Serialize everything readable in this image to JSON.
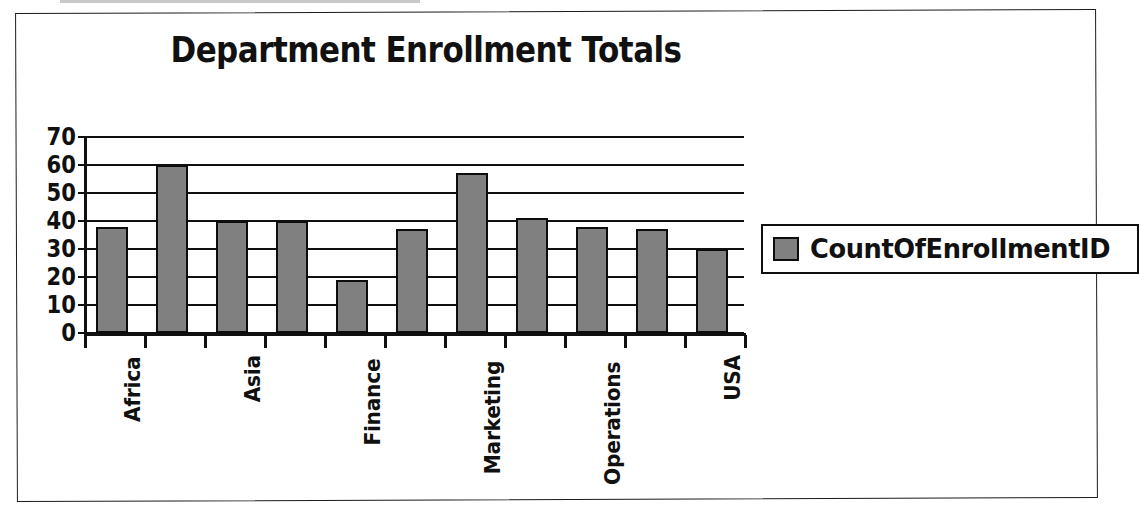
{
  "chart_data": {
    "type": "bar",
    "title": "Department Enrollment Totals",
    "xlabel": "",
    "ylabel": "",
    "ylim": [
      0,
      70
    ],
    "yticks": [
      0,
      10,
      20,
      30,
      40,
      50,
      60,
      70
    ],
    "grid": true,
    "legend_position": "right",
    "categories": [
      "Africa",
      "",
      "Asia",
      "",
      "Finance",
      "",
      "Marketing",
      "",
      "Operations",
      "",
      "USA"
    ],
    "visible_tick_labels": [
      "Africa",
      "Asia",
      "Finance",
      "Marketing",
      "Operations",
      "USA"
    ],
    "series": [
      {
        "name": "CountOfEnrollmentID",
        "color": "#808080",
        "values": [
          38,
          60,
          40,
          40,
          19,
          37,
          57,
          41,
          38,
          37,
          30
        ]
      }
    ]
  },
  "legend": {
    "entries": [
      {
        "label": "CountOfEnrollmentID",
        "color": "#808080"
      }
    ]
  },
  "colors": {
    "bar_fill": "#808080",
    "bar_outline": "#0d0d0d",
    "axis": "#101010",
    "text": "#111111",
    "page_border": "#1c1c1c",
    "background": "#ffffff"
  }
}
